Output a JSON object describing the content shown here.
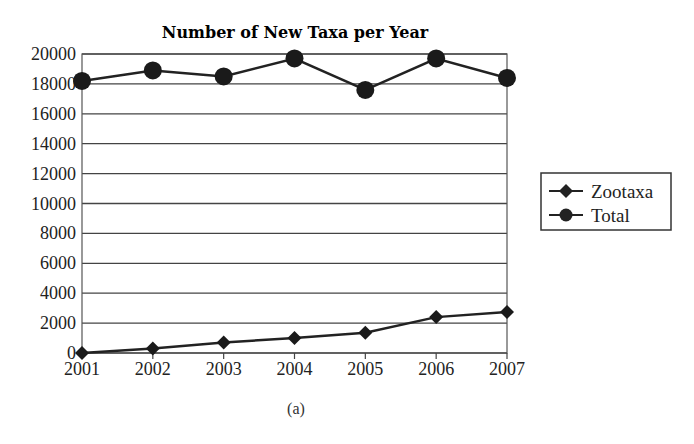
{
  "chart_data": {
    "type": "line",
    "title": "Number of New Taxa per Year",
    "xlabel": "",
    "ylabel": "",
    "caption": "(a)",
    "categories": [
      "2001",
      "2002",
      "2003",
      "2004",
      "2005",
      "2006",
      "2007"
    ],
    "yticks": [
      "0",
      "2000",
      "4000",
      "6000",
      "8000",
      "10000",
      "12000",
      "14000",
      "16000",
      "18000",
      "20000"
    ],
    "ylim": [
      0,
      20000
    ],
    "grid": true,
    "legend_position": "right",
    "series": [
      {
        "name": "Zootaxa",
        "marker": "diamond",
        "values": [
          0,
          300,
          700,
          1000,
          1350,
          2400,
          2750
        ]
      },
      {
        "name": "Total",
        "marker": "circle",
        "values": [
          18200,
          18900,
          18500,
          19700,
          17600,
          19700,
          18400
        ]
      }
    ]
  },
  "legend": {
    "items": [
      {
        "label": "Zootaxa",
        "marker": "diamond"
      },
      {
        "label": "Total",
        "marker": "circle"
      }
    ]
  }
}
